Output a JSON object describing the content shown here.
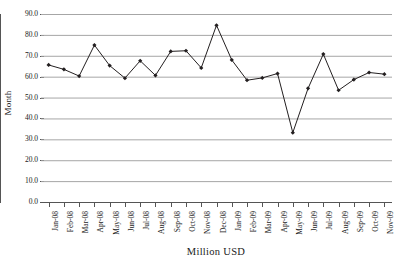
{
  "chart_data": {
    "type": "line",
    "title": "",
    "xlabel": "Million USD",
    "ylabel": "Month",
    "ylim": [
      0.0,
      90.0
    ],
    "ytick_step": 10.0,
    "grid": true,
    "legend": "none",
    "line_color": "#231f20",
    "grid_color": "#a6a6a6",
    "axis_color": "#555555",
    "marker": "diamond",
    "categories": [
      "Jan-08",
      "Feb-08",
      "Mar-08",
      "Apr-08",
      "May-08",
      "Jun-08",
      "Jul-08",
      "Aug-08",
      "Sep-08",
      "Oct-08",
      "Nov-08",
      "Dec-08",
      "Jan-09",
      "Feb-09",
      "Mar-09",
      "Apr-09",
      "May-09",
      "Jun-09",
      "Jul-09",
      "Aug-09",
      "Sep-09",
      "Oct-09",
      "Nov-09"
    ],
    "values": [
      65.6,
      63.5,
      60.3,
      75.1,
      65.3,
      59.3,
      67.6,
      60.6,
      72.1,
      72.4,
      64.2,
      84.6,
      68.0,
      58.3,
      59.4,
      61.5,
      33.2,
      54.4,
      70.8,
      53.5,
      58.6,
      62.0,
      61.2
    ],
    "ytick_labels": [
      "90.0",
      "80.0",
      "70.0",
      "60.0",
      "50.0",
      "40.0",
      "30.0",
      "20.0",
      "10.0",
      "0.0"
    ],
    "ytick_values": [
      90,
      80,
      70,
      60,
      50,
      40,
      30,
      20,
      10,
      0
    ]
  }
}
